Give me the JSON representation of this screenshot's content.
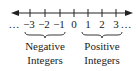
{
  "number_line": {
    "ticks": [
      {
        "value": "−3",
        "x": 30
      },
      {
        "value": "−2",
        "x": 45
      },
      {
        "value": "−1",
        "x": 60
      },
      {
        "value": "0",
        "x": 74
      },
      {
        "value": "1",
        "x": 88
      },
      {
        "value": "2",
        "x": 102
      },
      {
        "value": "3",
        "x": 116
      }
    ],
    "left_ellipsis": "…",
    "right_ellipsis": "…",
    "line_color": "#222222"
  },
  "groups": {
    "negative": {
      "line1": "Negative",
      "line2": "Integers"
    },
    "positive": {
      "line1": "Positive",
      "line2": "Integers"
    }
  }
}
